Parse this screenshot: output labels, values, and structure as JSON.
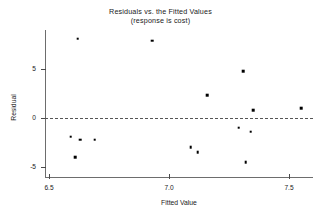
{
  "chart_data": {
    "type": "scatter",
    "title": "Residuals vs. the Fitted Values",
    "subtitle": "(response is cost)",
    "xlabel": "Fitted Value",
    "ylabel": "Residual",
    "xlim": [
      6.48,
      7.62
    ],
    "ylim": [
      -5.8,
      8.8
    ],
    "xticks": [
      6.5,
      7.0,
      7.5
    ],
    "xticklabels": [
      "6.5",
      "7.0",
      "7.5"
    ],
    "yticks": [
      5,
      0,
      -5
    ],
    "yticklabels": [
      "5",
      "0",
      "-5"
    ],
    "grid": false,
    "legend": null,
    "reference_line": {
      "type": "horizontal-dashed",
      "y": 0
    },
    "marker": {
      "shape": "square",
      "color": "#000000",
      "size": 2.6
    },
    "points": [
      {
        "x": 6.62,
        "y": 8.1
      },
      {
        "x": 6.93,
        "y": 7.9
      },
      {
        "x": 7.31,
        "y": 4.8
      },
      {
        "x": 7.16,
        "y": 2.3
      },
      {
        "x": 7.35,
        "y": 0.8
      },
      {
        "x": 7.55,
        "y": 1.0
      },
      {
        "x": 7.29,
        "y": -1.0
      },
      {
        "x": 7.34,
        "y": -1.4
      },
      {
        "x": 6.59,
        "y": -1.9
      },
      {
        "x": 6.63,
        "y": -2.2
      },
      {
        "x": 6.69,
        "y": -2.2
      },
      {
        "x": 7.09,
        "y": -3.0
      },
      {
        "x": 7.12,
        "y": -3.5
      },
      {
        "x": 6.61,
        "y": -4.0
      },
      {
        "x": 7.32,
        "y": -4.5
      }
    ]
  },
  "axes": {
    "y_title": "Residual",
    "x_title": "Fitted Value"
  }
}
